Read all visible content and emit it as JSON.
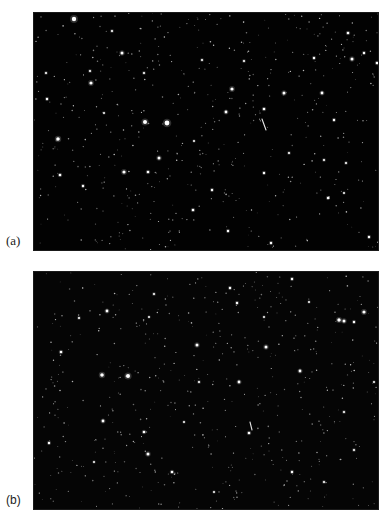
{
  "figure": {
    "panels": [
      {
        "id": "a",
        "label": "(a)",
        "background": "#020202",
        "streak": {
          "x1": 228,
          "y1": 106,
          "x2": 232,
          "y2": 117,
          "color": "#e8e8e8"
        },
        "bright_stars": [
          [
            40,
            6,
            2.2
          ],
          [
            111,
            109,
            2.0
          ],
          [
            133,
            110,
            2.4
          ],
          [
            88,
            40,
            1.5
          ],
          [
            57,
            70,
            1.6
          ],
          [
            24,
            126,
            1.8
          ],
          [
            90,
            159,
            1.6
          ],
          [
            125,
            145,
            1.5
          ],
          [
            114,
            159,
            1.3
          ],
          [
            198,
            76,
            1.6
          ],
          [
            192,
            99,
            1.4
          ],
          [
            230,
            96,
            1.3
          ],
          [
            250,
            80,
            1.5
          ],
          [
            288,
            80,
            1.4
          ],
          [
            318,
            46,
            1.5
          ],
          [
            343,
            50,
            1.3
          ],
          [
            314,
            20,
            1.3
          ],
          [
            13,
            86,
            1.2
          ],
          [
            26,
            162,
            1.3
          ],
          [
            49,
            173,
            1.2
          ],
          [
            178,
            177,
            1.2
          ],
          [
            230,
            160,
            1.2
          ],
          [
            294,
            185,
            1.2
          ],
          [
            159,
            197,
            1.3
          ],
          [
            194,
            218,
            1.2
          ],
          [
            335,
            224,
            1.2
          ],
          [
            237,
            230,
            1.2
          ],
          [
            300,
            107,
            1.2
          ],
          [
            280,
            45,
            1.2
          ],
          [
            330,
            40,
            1.2
          ],
          [
            12,
            60,
            1.1
          ],
          [
            78,
            18,
            1.1
          ],
          [
            110,
            60,
            1.1
          ],
          [
            56,
            58,
            1.1
          ],
          [
            168,
            47,
            1.1
          ],
          [
            210,
            48,
            1.1
          ],
          [
            290,
            147,
            1.1
          ],
          [
            312,
            150,
            1.1
          ],
          [
            255,
            140,
            1.1
          ],
          [
            310,
            180,
            1.0
          ],
          [
            160,
            128,
            1.0
          ],
          [
            70,
            100,
            1.0
          ]
        ]
      },
      {
        "id": "b",
        "label": "(b)",
        "background": "#050505",
        "streak": {
          "x1": 216,
          "y1": 150,
          "x2": 218,
          "y2": 158,
          "color": "#e0e0e0"
        },
        "bright_stars": [
          [
            94,
            104,
            2.0
          ],
          [
            68,
            103,
            1.8
          ],
          [
            73,
            39,
            1.4
          ],
          [
            330,
            40,
            1.6
          ],
          [
            305,
            48,
            1.7
          ],
          [
            310,
            49,
            1.5
          ],
          [
            163,
            73,
            1.5
          ],
          [
            232,
            75,
            1.5
          ],
          [
            266,
            99,
            1.4
          ],
          [
            205,
            110,
            1.4
          ],
          [
            27,
            80,
            1.3
          ],
          [
            114,
            182,
            1.5
          ],
          [
            69,
            149,
            1.4
          ],
          [
            110,
            160,
            1.3
          ],
          [
            15,
            171,
            1.2
          ],
          [
            215,
            161,
            1.3
          ],
          [
            138,
            200,
            1.3
          ],
          [
            258,
            200,
            1.2
          ],
          [
            320,
            50,
            1.2
          ],
          [
            258,
            7,
            1.2
          ],
          [
            203,
            31,
            1.2
          ],
          [
            196,
            16,
            1.2
          ],
          [
            310,
            140,
            1.1
          ],
          [
            350,
            88,
            1.1
          ],
          [
            45,
            46,
            1.1
          ],
          [
            120,
            22,
            1.1
          ],
          [
            165,
            110,
            1.1
          ],
          [
            320,
            178,
            1.1
          ],
          [
            290,
            210,
            1.1
          ],
          [
            60,
            190,
            1.0
          ],
          [
            180,
            220,
            1.0
          ],
          [
            230,
            45,
            1.0
          ],
          [
            275,
            30,
            1.0
          ],
          [
            115,
            45,
            1.0
          ],
          [
            340,
            110,
            1.0
          ],
          [
            150,
            150,
            1.0
          ]
        ]
      }
    ],
    "faint_star_count": 520
  }
}
